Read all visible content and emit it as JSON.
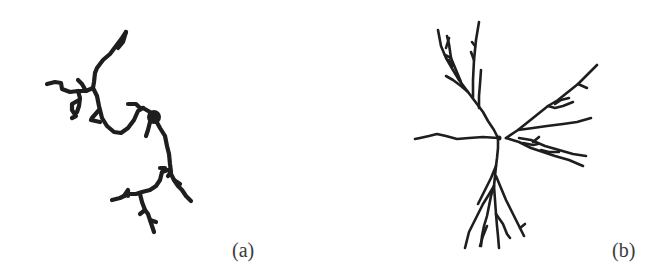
{
  "figure": {
    "panels": [
      {
        "id": "a",
        "label": "(a)",
        "description": "Sparse, irregular branching dendritic cluster with a dense node near the center"
      },
      {
        "id": "b",
        "label": "(b)",
        "description": "Radially branching dendritic (tree-like) structure with several main arms emanating from a central point"
      }
    ],
    "colors": {
      "background": "#ffffff",
      "stroke": "#1e1e1e",
      "label": "#3a3a3a"
    }
  }
}
